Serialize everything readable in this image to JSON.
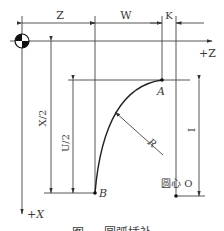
{
  "diagram": {
    "labels": {
      "z": "Z",
      "w": "W",
      "k": "K",
      "plus_z": "+Z",
      "plus_x": "+X",
      "x_half": "X/2",
      "u_half": "U/2",
      "i": "I",
      "r": "R",
      "point_a": "A",
      "point_b": "B",
      "center": "圆心 O"
    },
    "caption": "图 — 圆弧插补"
  },
  "colors": {
    "line": "#444444",
    "arc": "#222222",
    "text": "#3a3a3a"
  }
}
